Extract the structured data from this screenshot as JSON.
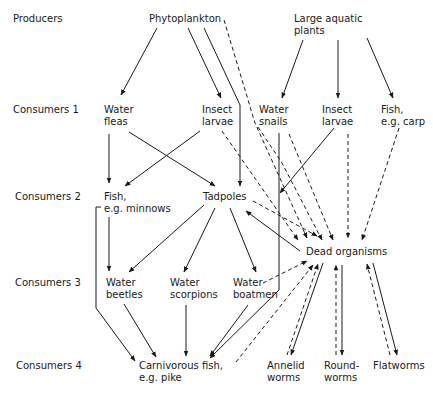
{
  "levels": [
    {
      "label": "Producers",
      "x": 13,
      "y": 13
    },
    {
      "label": "Consumers 1",
      "x": 13,
      "y": 104
    },
    {
      "label": "Consumers 2",
      "x": 15,
      "y": 191
    },
    {
      "label": "Consumers 3",
      "x": 15,
      "y": 277
    },
    {
      "label": "Consumers 4",
      "x": 16,
      "y": 360
    }
  ],
  "nodes": [
    {
      "id": "phytoplankton",
      "label": "Phytoplankton",
      "x": 149,
      "y": 13
    },
    {
      "id": "large-aquatic-plants",
      "label": "Large aquatic\nplants",
      "x": 294,
      "y": 13
    },
    {
      "id": "water-fleas",
      "label": "Water\nfleas",
      "x": 104,
      "y": 104
    },
    {
      "id": "insect-larvae-1",
      "label": "Insect\nlarvae",
      "x": 202,
      "y": 104
    },
    {
      "id": "water-snails",
      "label": "Water\nsnails",
      "x": 259,
      "y": 104
    },
    {
      "id": "insect-larvae-2",
      "label": "Insect\nlarvae",
      "x": 322,
      "y": 104
    },
    {
      "id": "fish-carp",
      "label": "Fish,\ne.g. carp",
      "x": 381,
      "y": 104
    },
    {
      "id": "fish-minnows",
      "label": "Fish,\ne.g. minnows",
      "x": 104,
      "y": 191
    },
    {
      "id": "tadpoles",
      "label": "Tadpoles",
      "x": 203,
      "y": 191
    },
    {
      "id": "dead-organisms",
      "label": "Dead organisms",
      "x": 306,
      "y": 246
    },
    {
      "id": "water-beetles",
      "label": "Water\nbeetles",
      "x": 106,
      "y": 277
    },
    {
      "id": "water-scorpions",
      "label": "Water\nscorpions",
      "x": 170,
      "y": 277
    },
    {
      "id": "water-boatmen",
      "label": "Water\nboatmen",
      "x": 233,
      "y": 277
    },
    {
      "id": "carnivorous-fish",
      "label": "Carnivorous fish,\ne.g. pike",
      "x": 139,
      "y": 360
    },
    {
      "id": "annelid-worms",
      "label": "Annelid\nworms",
      "x": 267,
      "y": 360
    },
    {
      "id": "roundworms",
      "label": "Round-\nworms",
      "x": 324,
      "y": 360
    },
    {
      "id": "flatworms",
      "label": "Flatworms",
      "x": 373,
      "y": 360
    }
  ],
  "edges": {
    "solid": [
      {
        "from": "phytoplankton",
        "to": "water-fleas",
        "d": "M157,28 L121,95"
      },
      {
        "from": "phytoplankton",
        "to": "insect-larvae-1",
        "d": "M188,28 L221,98"
      },
      {
        "from": "phytoplankton",
        "to": "tadpoles",
        "d": "M204,28 L240,105 L240,186"
      },
      {
        "from": "large-aquatic-plants",
        "to": "water-snails",
        "d": "M303,40 L282,98"
      },
      {
        "from": "large-aquatic-plants",
        "to": "insect-larvae-2",
        "d": "M338,40 L338,98"
      },
      {
        "from": "large-aquatic-plants",
        "to": "fish-carp",
        "d": "M367,38 L393,98"
      },
      {
        "from": "water-fleas",
        "to": "fish-minnows",
        "d": "M109,134 L109,183"
      },
      {
        "from": "water-fleas",
        "to": "tadpoles",
        "d": "M129,132 L215,186"
      },
      {
        "from": "insect-larvae-1",
        "to": "fish-minnows",
        "d": "M200,131 L125,186"
      },
      {
        "from": "water-snails",
        "to": "carnivorous-fish",
        "d": "M279,133 L279,290 L210,358"
      },
      {
        "from": "insect-larvae-2",
        "to": "water-snails-line",
        "d": "M334,128 L280,193"
      },
      {
        "from": "fish-minnows",
        "to": "water-beetles",
        "d": "M109,217 L109,271"
      },
      {
        "from": "fish-minnows",
        "to": "carnivorous-fish",
        "d": "M101,207 L96,207 L96,308 L135,361"
      },
      {
        "from": "tadpoles",
        "to": "water-beetles",
        "d": "M204,205 L129,272"
      },
      {
        "from": "tadpoles",
        "to": "water-scorpions",
        "d": "M215,208 L184,272"
      },
      {
        "from": "tadpoles",
        "to": "water-boatmen",
        "d": "M230,208 L256,272"
      },
      {
        "from": "dead-organisms",
        "to": "tadpoles",
        "d": "M300,251 L246,211"
      },
      {
        "from": "water-beetles",
        "to": "carnivorous-fish",
        "d": "M124,304 L156,357"
      },
      {
        "from": "water-scorpions",
        "to": "carnivorous-fish",
        "d": "M186,305 L186,356"
      },
      {
        "from": "water-boatmen",
        "to": "carnivorous-fish",
        "d": "M248,305 L210,356"
      },
      {
        "from": "dead-organisms",
        "to": "annelid-worms",
        "d": "M323,263 L291,355"
      },
      {
        "from": "dead-organisms",
        "to": "roundworms",
        "d": "M342,265 L342,355"
      },
      {
        "from": "dead-organisms",
        "to": "flatworms",
        "d": "M373,263 L397,355"
      }
    ],
    "dashed": [
      {
        "from": "phytoplankton",
        "to": "dead-organisms",
        "d": "M224,20 L255,123 L307,238"
      },
      {
        "from": "insect-larvae-1",
        "to": "dead-organisms",
        "d": "M222,131 L298,240"
      },
      {
        "from": "water-snails",
        "to": "dead-organisms",
        "d": "M258,127 L282,163 L322,240"
      },
      {
        "from": "water-snails",
        "to": "dead-organisms",
        "d": "M289,134 L333,240"
      },
      {
        "from": "insect-larvae-2",
        "to": "dead-organisms",
        "d": "M348,134 L348,238"
      },
      {
        "from": "fish-carp",
        "to": "dead-organisms",
        "d": "M399,128 L362,240"
      },
      {
        "from": "tadpoles",
        "to": "dead-organisms",
        "d": "M253,201 L317,236"
      },
      {
        "from": "water-boatmen",
        "to": "dead-organisms",
        "d": "M263,283 L307,261"
      },
      {
        "from": "carnivorous-fish",
        "to": "dead-organisms",
        "d": "M236,362 L313,265"
      },
      {
        "from": "annelid-worms",
        "to": "dead-organisms",
        "d": "M287,355 L318,264"
      },
      {
        "from": "roundworms",
        "to": "dead-organisms",
        "d": "M336,355 L336,265"
      },
      {
        "from": "flatworms",
        "to": "dead-organisms",
        "d": "M390,355 L367,264"
      }
    ]
  },
  "colors": {
    "ink": "#1a1a1a",
    "background": "#ffffff"
  }
}
